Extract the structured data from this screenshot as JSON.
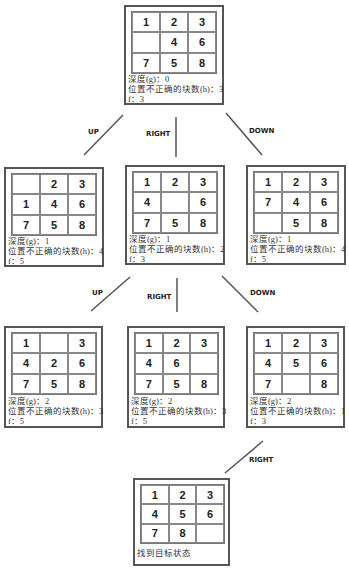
{
  "labels": {
    "depth": "深度(g)：",
    "misplaced": "位置不正确的块数(h)：",
    "f": "f：",
    "goal": "找到目标状态"
  },
  "nodes": {
    "root": {
      "tiles": [
        "1",
        "2",
        "3",
        "",
        "4",
        "6",
        "7",
        "5",
        "8"
      ],
      "g": "0",
      "h": "3",
      "f": "3"
    },
    "l1_up": {
      "tiles": [
        "",
        "2",
        "3",
        "1",
        "4",
        "6",
        "7",
        "5",
        "8"
      ],
      "g": "1",
      "h": "4",
      "f": "5"
    },
    "l1_right": {
      "tiles": [
        "1",
        "2",
        "3",
        "4",
        "",
        "6",
        "7",
        "5",
        "8"
      ],
      "g": "1",
      "h": "2",
      "f": "3"
    },
    "l1_down": {
      "tiles": [
        "1",
        "2",
        "3",
        "7",
        "4",
        "6",
        "",
        "5",
        "8"
      ],
      "g": "1",
      "h": "4",
      "f": "5"
    },
    "l2_up": {
      "tiles": [
        "1",
        "",
        "3",
        "4",
        "2",
        "6",
        "7",
        "5",
        "8"
      ],
      "g": "2",
      "h": "3",
      "f": "5"
    },
    "l2_right": {
      "tiles": [
        "1",
        "2",
        "3",
        "4",
        "6",
        "",
        "7",
        "5",
        "8"
      ],
      "g": "2",
      "h": "3",
      "f": "5"
    },
    "l2_down": {
      "tiles": [
        "1",
        "2",
        "3",
        "4",
        "5",
        "6",
        "7",
        "",
        "8"
      ],
      "g": "2",
      "h": "1",
      "f": "3"
    },
    "goal": {
      "tiles": [
        "1",
        "2",
        "3",
        "4",
        "5",
        "6",
        "7",
        "8",
        ""
      ]
    }
  },
  "edges": {
    "l1_up": "UP",
    "l1_right": "RIGHT",
    "l1_down": "DOWN",
    "l2_up": "UP",
    "l2_right": "RIGHT",
    "l2_down": "DOWN",
    "goal": "RIGHT"
  },
  "colors": {
    "border": "#555555",
    "line": "#555555",
    "text": "#222222"
  }
}
